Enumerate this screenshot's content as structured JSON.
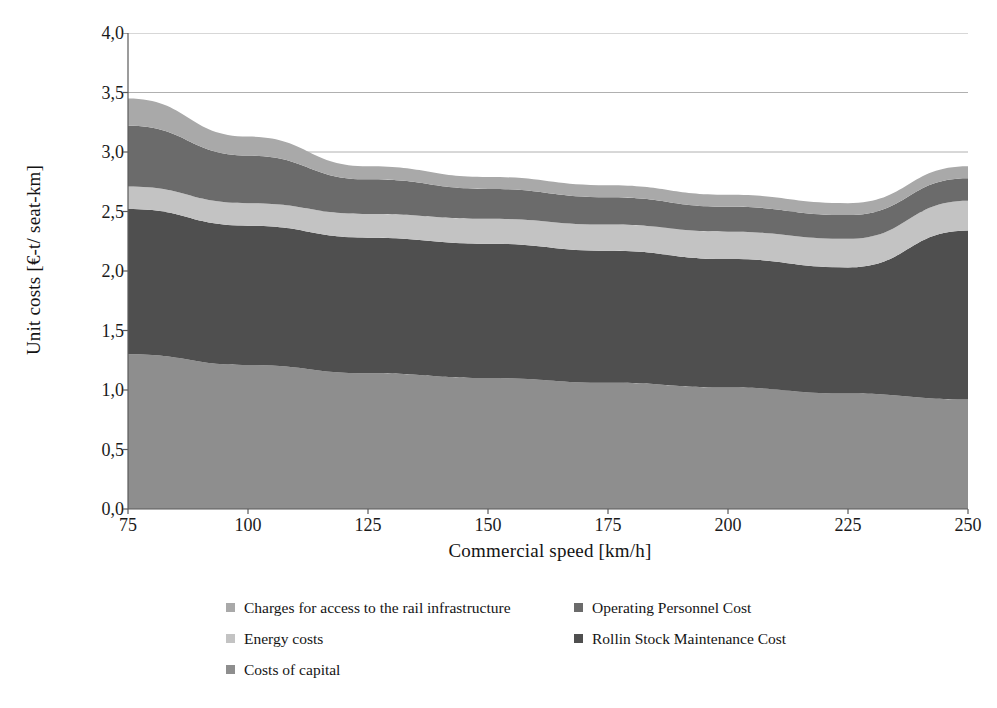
{
  "chart_data": {
    "type": "area",
    "title": "",
    "subtitle": "",
    "xlabel": "Commercial speed [km/h]",
    "ylabel": "Unit costs [€-t/ seat-km]",
    "stacked": true,
    "grid": true,
    "legend_position": "bottom",
    "xlim": [
      75,
      250
    ],
    "ylim": [
      0.0,
      4.0
    ],
    "xticks": [
      75,
      100,
      125,
      150,
      175,
      200,
      225,
      250
    ],
    "xtick_labels": [
      "75",
      "100",
      "125",
      "150",
      "175",
      "200",
      "225",
      "250"
    ],
    "yticks": [
      0.0,
      0.5,
      1.0,
      1.5,
      2.0,
      2.5,
      3.0,
      3.5,
      4.0
    ],
    "ytick_labels": [
      "0,0",
      "0,5",
      "1,0",
      "1,5",
      "2,0",
      "2,5",
      "3,0",
      "3,5",
      "4,0"
    ],
    "x": [
      75,
      100,
      125,
      150,
      175,
      200,
      225,
      250
    ],
    "series": [
      {
        "name": "Costs of capital",
        "color": "#8e8e8e",
        "values": [
          1.3,
          1.21,
          1.14,
          1.1,
          1.06,
          1.02,
          0.97,
          0.92
        ]
      },
      {
        "name": "Rollin Stock Maintenance Cost",
        "color": "#4f4f4f",
        "values": [
          1.22,
          1.17,
          1.14,
          1.13,
          1.11,
          1.08,
          1.06,
          1.42
        ]
      },
      {
        "name": "Energy costs",
        "color": "#c3c3c3",
        "values": [
          0.19,
          0.19,
          0.2,
          0.21,
          0.22,
          0.23,
          0.24,
          0.25
        ]
      },
      {
        "name": "Operating Personnel Cost",
        "color": "#6b6b6b",
        "values": [
          0.51,
          0.4,
          0.29,
          0.25,
          0.23,
          0.21,
          0.2,
          0.19
        ]
      },
      {
        "name": "Charges for access to the rail infrastructure",
        "color": "#a9a9a9",
        "values": [
          0.23,
          0.16,
          0.11,
          0.1,
          0.1,
          0.1,
          0.1,
          0.1
        ]
      }
    ],
    "cumulative_tops": {
      "costs_of_capital": [
        1.3,
        1.21,
        1.14,
        1.1,
        1.06,
        1.02,
        0.97,
        0.92
      ],
      "rolling_stock_maintenance": [
        2.52,
        2.38,
        2.28,
        2.23,
        2.17,
        2.1,
        2.03,
        2.34
      ],
      "energy_costs": [
        2.71,
        2.57,
        2.48,
        2.44,
        2.39,
        2.33,
        2.27,
        2.59
      ],
      "operating_personnel": [
        3.22,
        2.97,
        2.77,
        2.69,
        2.62,
        2.54,
        2.47,
        2.78
      ],
      "total": [
        3.45,
        3.13,
        2.88,
        2.79,
        2.72,
        2.64,
        2.57,
        2.88
      ]
    }
  },
  "legend": {
    "left_column": [
      {
        "label": "Charges for access to the rail infrastructure",
        "color": "#a9a9a9"
      },
      {
        "label": "Energy costs",
        "color": "#c3c3c3"
      },
      {
        "label": "Costs of capital",
        "color": "#8e8e8e"
      }
    ],
    "right_column": [
      {
        "label": "Operating Personnel Cost",
        "color": "#6b6b6b"
      },
      {
        "label": "Rollin Stock Maintenance Cost",
        "color": "#4f4f4f"
      }
    ]
  },
  "axes": {
    "x_title": "Commercial speed [km/h]",
    "y_title": "Unit costs [€-t/ seat-km]"
  },
  "style": {
    "grid_color": "#b0b0b0",
    "axis_color": "#5a5a5a",
    "background": "#ffffff"
  }
}
